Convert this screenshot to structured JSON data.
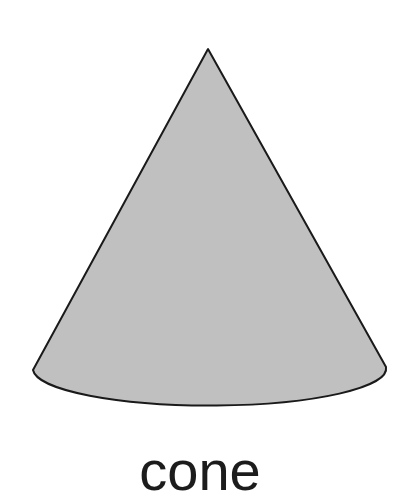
{
  "page": {
    "title": "cone",
    "background_color": "#ffffff",
    "width": 496,
    "height": 400
  },
  "figure": {
    "name": "cone-shape",
    "shape_kind": "cone",
    "fill_color": "#c0c0c0",
    "stroke_color": "#1a1a1a",
    "stroke_width": 2,
    "apex": {
      "x": 208,
      "y": 49
    },
    "base_left": {
      "x": 33,
      "y": 370
    },
    "base_right": {
      "x": 386,
      "y": 367
    },
    "base_bottom": {
      "x": 210,
      "y": 405
    },
    "base_center": {
      "x": 209.5,
      "y": 368.5
    },
    "base_radius_x": 176.5,
    "base_radius_y": 37
  },
  "caption": {
    "label": "cone",
    "color": "#1c1c1c",
    "font_size_px": 56
  }
}
